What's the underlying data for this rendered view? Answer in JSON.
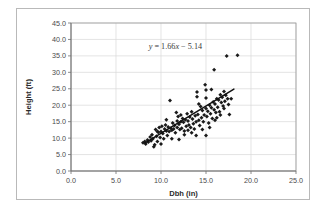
{
  "chart_data": {
    "type": "scatter",
    "title": "",
    "xlabel": "Dbh (in)",
    "ylabel": "Height (ft)",
    "xlim": [
      0.0,
      25.0
    ],
    "ylim": [
      0.0,
      45.0
    ],
    "xticks": [
      "0.0",
      "5.0",
      "10.0",
      "15.0",
      "20.0",
      "25.0"
    ],
    "yticks": [
      "0.0",
      "5.0",
      "10.0",
      "15.0",
      "20.0",
      "25.0",
      "30.0",
      "35.0",
      "40.0",
      "45.0"
    ],
    "xtick_values": [
      0,
      5,
      10,
      15,
      20,
      25
    ],
    "ytick_values": [
      0,
      5,
      10,
      15,
      20,
      25,
      30,
      35,
      40,
      45
    ],
    "grid": true,
    "legend": "none",
    "annotation": "y = 1.66x - 5.14",
    "annotation_parts": {
      "y": "y",
      "rest": " = 1.66",
      "x": "x",
      "tail": " − 5.14"
    },
    "annotation_x": 11.6,
    "annotation_y": 37.0,
    "trendline": {
      "slope": 1.66,
      "intercept": -5.14,
      "x_start": 8.2,
      "x_end": 18.1
    },
    "marker_style": "diamond",
    "marker_color": "#1a1a1a",
    "points": [
      [
        8.0,
        8.6
      ],
      [
        8.2,
        9.0
      ],
      [
        8.3,
        8.2
      ],
      [
        8.5,
        9.4
      ],
      [
        8.6,
        8.8
      ],
      [
        8.8,
        10.3
      ],
      [
        8.9,
        9.2
      ],
      [
        9.0,
        11.0
      ],
      [
        9.1,
        9.8
      ],
      [
        9.2,
        7.4
      ],
      [
        9.3,
        8.0
      ],
      [
        9.4,
        12.6
      ],
      [
        9.5,
        10.6
      ],
      [
        9.6,
        9.0
      ],
      [
        9.7,
        11.8
      ],
      [
        9.8,
        13.2
      ],
      [
        9.9,
        10.2
      ],
      [
        10.0,
        12.0
      ],
      [
        10.1,
        13.6
      ],
      [
        10.2,
        11.4
      ],
      [
        10.3,
        9.8
      ],
      [
        10.4,
        12.8
      ],
      [
        10.5,
        14.0
      ],
      [
        10.6,
        12.2
      ],
      [
        10.7,
        10.8
      ],
      [
        10.8,
        13.4
      ],
      [
        10.9,
        12.0
      ],
      [
        11.0,
        21.4
      ],
      [
        11.1,
        13.0
      ],
      [
        11.2,
        12.4
      ],
      [
        11.3,
        14.6
      ],
      [
        11.4,
        12.8
      ],
      [
        11.5,
        13.8
      ],
      [
        11.6,
        11.6
      ],
      [
        11.7,
        17.8
      ],
      [
        11.8,
        13.2
      ],
      [
        11.9,
        16.6
      ],
      [
        12.0,
        14.2
      ],
      [
        12.1,
        12.6
      ],
      [
        12.2,
        15.0
      ],
      [
        12.3,
        13.0
      ],
      [
        12.4,
        16.0
      ],
      [
        12.5,
        14.8
      ],
      [
        12.6,
        12.2
      ],
      [
        12.7,
        15.6
      ],
      [
        12.8,
        13.6
      ],
      [
        12.9,
        17.4
      ],
      [
        13.0,
        15.2
      ],
      [
        13.1,
        14.0
      ],
      [
        13.2,
        16.4
      ],
      [
        13.3,
        13.2
      ],
      [
        13.4,
        18.0
      ],
      [
        13.5,
        15.8
      ],
      [
        13.6,
        14.4
      ],
      [
        13.7,
        12.8
      ],
      [
        13.8,
        16.8
      ],
      [
        13.9,
        15.0
      ],
      [
        14.0,
        24.0
      ],
      [
        14.0,
        22.6
      ],
      [
        14.1,
        17.2
      ],
      [
        14.2,
        15.4
      ],
      [
        14.3,
        13.8
      ],
      [
        14.4,
        19.6
      ],
      [
        14.5,
        16.2
      ],
      [
        14.6,
        18.4
      ],
      [
        14.7,
        15.0
      ],
      [
        14.8,
        17.0
      ],
      [
        14.9,
        26.2
      ],
      [
        15.0,
        19.0
      ],
      [
        15.0,
        24.6
      ],
      [
        15.0,
        22.2
      ],
      [
        15.1,
        16.6
      ],
      [
        15.2,
        18.2
      ],
      [
        15.3,
        14.6
      ],
      [
        15.4,
        20.0
      ],
      [
        15.5,
        17.4
      ],
      [
        15.6,
        19.2
      ],
      [
        15.7,
        16.0
      ],
      [
        15.8,
        21.0
      ],
      [
        15.9,
        18.6
      ],
      [
        15.9,
        30.8
      ],
      [
        16.0,
        20.4
      ],
      [
        16.1,
        17.8
      ],
      [
        16.2,
        22.0
      ],
      [
        16.3,
        19.4
      ],
      [
        16.4,
        21.6
      ],
      [
        16.5,
        18.0
      ],
      [
        16.6,
        23.2
      ],
      [
        16.7,
        20.8
      ],
      [
        16.8,
        22.4
      ],
      [
        16.9,
        19.8
      ],
      [
        17.0,
        24.2
      ],
      [
        17.1,
        21.2
      ],
      [
        17.2,
        23.0
      ],
      [
        17.3,
        35.0
      ],
      [
        17.4,
        22.0
      ],
      [
        17.5,
        20.2
      ],
      [
        17.6,
        17.2
      ],
      [
        17.8,
        22.0
      ],
      [
        18.5,
        35.2
      ],
      [
        15.0,
        10.8
      ],
      [
        13.9,
        10.8
      ],
      [
        12.0,
        9.6
      ],
      [
        11.2,
        9.8
      ],
      [
        10.0,
        8.2
      ],
      [
        16.0,
        15.4
      ],
      [
        16.6,
        17.0
      ],
      [
        14.6,
        12.6
      ],
      [
        13.4,
        11.6
      ],
      [
        12.6,
        11.0
      ],
      [
        9.6,
        12.0
      ],
      [
        10.6,
        15.6
      ],
      [
        11.8,
        15.2
      ],
      [
        12.2,
        17.0
      ],
      [
        13.0,
        12.4
      ],
      [
        14.2,
        20.4
      ],
      [
        15.6,
        24.8
      ],
      [
        16.2,
        16.2
      ],
      [
        17.0,
        19.0
      ],
      [
        15.4,
        13.2
      ]
    ]
  }
}
